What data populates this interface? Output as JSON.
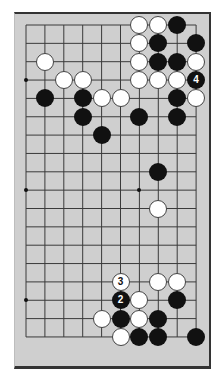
{
  "diagram": {
    "type": "go-board-partial",
    "colors": {
      "board": "#cfcfcf",
      "line": "#3a3a3a",
      "black": "#111111",
      "white": "#ffffff"
    },
    "grid": {
      "cols": 10,
      "rows": 18,
      "x0": 26,
      "y0": 25,
      "dx": 18.9,
      "dy": 18.35
    },
    "star_points": [
      {
        "col": 0,
        "row": 3
      },
      {
        "col": 0,
        "row": 9
      },
      {
        "col": 6,
        "row": 9
      },
      {
        "col": 0,
        "row": 15
      }
    ],
    "stones": [
      {
        "col": 6,
        "row": 0,
        "color": "w"
      },
      {
        "col": 7,
        "row": 0,
        "color": "w"
      },
      {
        "col": 8,
        "row": 0,
        "color": "b"
      },
      {
        "col": 6,
        "row": 1,
        "color": "w"
      },
      {
        "col": 7,
        "row": 1,
        "color": "b"
      },
      {
        "col": 9,
        "row": 1,
        "color": "b"
      },
      {
        "col": 1,
        "row": 2,
        "color": "w"
      },
      {
        "col": 6,
        "row": 2,
        "color": "w"
      },
      {
        "col": 7,
        "row": 2,
        "color": "b"
      },
      {
        "col": 8,
        "row": 2,
        "color": "b"
      },
      {
        "col": 9,
        "row": 2,
        "color": "w"
      },
      {
        "col": 2,
        "row": 3,
        "color": "w"
      },
      {
        "col": 3,
        "row": 3,
        "color": "w"
      },
      {
        "col": 6,
        "row": 3,
        "color": "w"
      },
      {
        "col": 7,
        "row": 3,
        "color": "w"
      },
      {
        "col": 8,
        "row": 3,
        "color": "w"
      },
      {
        "col": 9,
        "row": 3,
        "color": "b",
        "label": "4"
      },
      {
        "col": 1,
        "row": 4,
        "color": "b"
      },
      {
        "col": 3,
        "row": 4,
        "color": "b"
      },
      {
        "col": 4,
        "row": 4,
        "color": "w"
      },
      {
        "col": 5,
        "row": 4,
        "color": "w"
      },
      {
        "col": 8,
        "row": 4,
        "color": "b"
      },
      {
        "col": 9,
        "row": 4,
        "color": "w"
      },
      {
        "col": 3,
        "row": 5,
        "color": "b"
      },
      {
        "col": 6,
        "row": 5,
        "color": "b"
      },
      {
        "col": 8,
        "row": 5,
        "color": "b"
      },
      {
        "col": 4,
        "row": 6,
        "color": "b"
      },
      {
        "col": 7,
        "row": 8,
        "color": "b"
      },
      {
        "col": 7,
        "row": 10,
        "color": "w"
      },
      {
        "col": 5,
        "row": 14,
        "color": "w",
        "label": "3"
      },
      {
        "col": 7,
        "row": 14,
        "color": "w"
      },
      {
        "col": 8,
        "row": 14,
        "color": "w"
      },
      {
        "col": 5,
        "row": 15,
        "color": "b",
        "label": "2"
      },
      {
        "col": 6,
        "row": 15,
        "color": "w"
      },
      {
        "col": 8,
        "row": 15,
        "color": "b"
      },
      {
        "col": 4,
        "row": 16,
        "color": "w"
      },
      {
        "col": 5,
        "row": 16,
        "color": "b"
      },
      {
        "col": 6,
        "row": 16,
        "color": "w"
      },
      {
        "col": 7,
        "row": 16,
        "color": "b"
      },
      {
        "col": 5,
        "row": 17,
        "color": "w"
      },
      {
        "col": 6,
        "row": 17,
        "color": "b"
      },
      {
        "col": 7,
        "row": 17,
        "color": "b"
      },
      {
        "col": 9,
        "row": 17,
        "color": "b"
      }
    ]
  }
}
